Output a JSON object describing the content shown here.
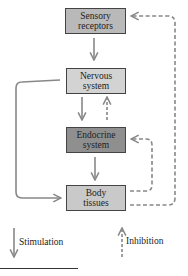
{
  "nodes": {
    "sensory": {
      "line1": "Sensory",
      "line2": "receptors",
      "fill": "#b9b9b9"
    },
    "nervous": {
      "line1": "Nervous",
      "line2": "system",
      "fill": "#d3d3d3"
    },
    "endocrine": {
      "line1": "Endocrine",
      "line2": "system",
      "fill": "#8f8f8f"
    },
    "body": {
      "line1": "Body",
      "line2": "tissues",
      "fill": "#c9c9c9"
    }
  },
  "edges": [
    {
      "from": "sensory",
      "to": "nervous",
      "type": "stimulation"
    },
    {
      "from": "nervous",
      "to": "endocrine",
      "type": "stimulation"
    },
    {
      "from": "endocrine",
      "to": "nervous",
      "type": "inhibition"
    },
    {
      "from": "endocrine",
      "to": "body",
      "type": "stimulation"
    },
    {
      "from": "nervous",
      "to": "body",
      "type": "stimulation"
    },
    {
      "from": "body",
      "to": "endocrine",
      "type": "inhibition"
    },
    {
      "from": "body",
      "to": "sensory",
      "type": "inhibition"
    }
  ],
  "legend": {
    "stimulation": "Stimulation",
    "inhibition": "Inhibition"
  },
  "colors": {
    "arrow": "#888888"
  }
}
